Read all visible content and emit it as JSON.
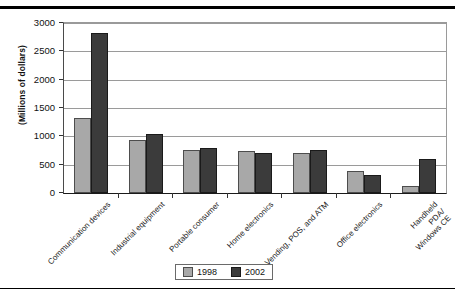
{
  "chart_data": {
    "type": "bar",
    "title": "",
    "subtitle": "",
    "xlabel": "",
    "ylabel": "(Millions of dollars)",
    "ylim": [
      0,
      3000
    ],
    "ytick_step": 500,
    "yticks": [
      "0",
      "500",
      "1000",
      "1500",
      "2000",
      "2500",
      "3000"
    ],
    "grid": true,
    "legend_position": "bottom-center",
    "categories": [
      "Communication devices",
      "Industrial equipment",
      "Portable consumer",
      "Home electronics",
      "Vending, POS, and ATM",
      "Office electronics",
      "Handheld PDA/ Windows CE"
    ],
    "series": [
      {
        "name": "1998",
        "color": "#a8a8a8",
        "values": [
          1320,
          935,
          760,
          740,
          705,
          385,
          125
        ]
      },
      {
        "name": "2002",
        "color": "#3b3b3b",
        "values": [
          2820,
          1045,
          800,
          700,
          760,
          315,
          600
        ]
      }
    ]
  },
  "legend": {
    "entries": [
      {
        "label": "1998"
      },
      {
        "label": "2002"
      }
    ]
  },
  "axis": {
    "y_title": "(Millions of dollars)"
  }
}
